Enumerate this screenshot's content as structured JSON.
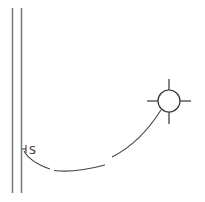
{
  "diagram": {
    "type": "electrical-floor-plan-symbol",
    "wall": {
      "color": "#777777",
      "x1": 12.5,
      "x2": 21.5,
      "y_top": 8,
      "y_bottom": 193
    },
    "switch": {
      "label": "S",
      "x": 24,
      "y": 150,
      "color": "#333333"
    },
    "light_fixture": {
      "cx": 169,
      "cy": 101,
      "r": 11,
      "arm": 11,
      "color": "#333333"
    },
    "connection": {
      "style": "dashed-arc",
      "color": "#444444"
    }
  }
}
